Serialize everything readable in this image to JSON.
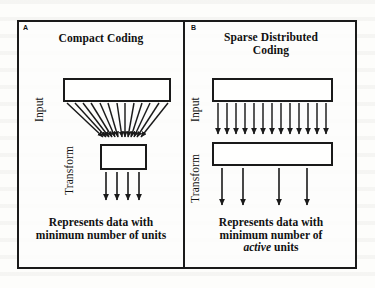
{
  "figure": {
    "type": "diagram",
    "background_color": "#fdfdfb",
    "ink_color": "#1a1a1a",
    "panels": [
      {
        "letter": "A",
        "title": "Compact Coding",
        "labels": {
          "input": "Input",
          "transform": "Transform"
        },
        "caption_line1": "Represents data with",
        "caption_line2": "minimum number of units",
        "caption_emphasis": "",
        "input_box": {
          "x": 46,
          "y": 58,
          "w": 108,
          "h": 24
        },
        "transform_box": {
          "x": 83,
          "y": 124,
          "w": 47,
          "h": 26
        },
        "connection_style": "converging",
        "connection_count": 13,
        "output_arrow_count": 4,
        "output_arrow_positions": [
          89,
          100,
          111,
          122
        ]
      },
      {
        "letter": "B",
        "title_line1": "Sparse Distributed",
        "title_line2": "Coding",
        "labels": {
          "input": "Input",
          "transform": "Transform"
        },
        "caption_line1": "Represents data with",
        "caption_line2": "minimum number of",
        "caption_emphasis": "active",
        "caption_line3_suffix": " units",
        "input_box": {
          "x": 27,
          "y": 58,
          "w": 121,
          "h": 24
        },
        "transform_box": {
          "x": 27,
          "y": 122,
          "w": 121,
          "h": 24
        },
        "connection_style": "parallel",
        "connection_count": 13,
        "output_arrow_count": 4,
        "output_arrow_positions": [
          37,
          58,
          94,
          122
        ]
      }
    ]
  }
}
